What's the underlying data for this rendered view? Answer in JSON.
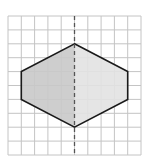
{
  "diagram": {
    "type": "grid-symmetry-figure",
    "grid": {
      "columns": 10,
      "rows": 10,
      "origin_px": [
        8,
        16
      ],
      "cell_w_px": 13.3,
      "cell_h_px": 13.9,
      "line_color": "#c4c4c4"
    },
    "axis_of_symmetry": {
      "orientation": "vertical",
      "column": 5,
      "style": "dashed",
      "color": "#555555"
    },
    "shape": {
      "name": "hexagon",
      "vertices_grid": [
        [
          5,
          2
        ],
        [
          9,
          4
        ],
        [
          9,
          6
        ],
        [
          5,
          8
        ],
        [
          1,
          6
        ],
        [
          1,
          4
        ]
      ],
      "stroke_color": "#1a1a1a",
      "left_half_fill": "#c9c9c9",
      "right_half_fill": "#e2e2e2"
    }
  }
}
